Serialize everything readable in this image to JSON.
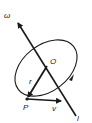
{
  "diagram": {
    "type": "rotation-about-axis",
    "labels": {
      "omega": "ω",
      "axis": "l",
      "center": "O",
      "point": "P",
      "radius": "r",
      "velocity": "v"
    },
    "colors": {
      "stroke": "#1a1a1a",
      "background": "#ffffff"
    }
  }
}
